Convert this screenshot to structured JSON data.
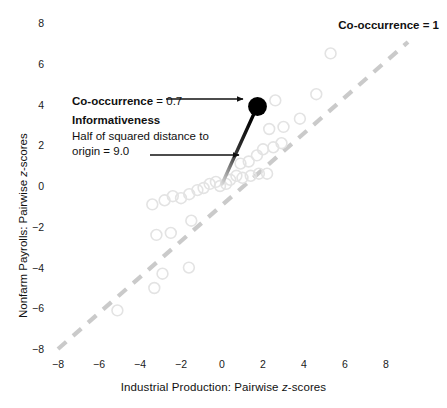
{
  "chart_data": {
    "type": "scatter",
    "title": "",
    "xlabel": "Industrial Production:  Pairwise z-scores",
    "ylabel": "Nonfarm Payrolls:  Pairwise z-scores",
    "xlim": [
      -8.8,
      8.8
    ],
    "ylim": [
      -8.8,
      8.8
    ],
    "xticks": [
      -8,
      -6,
      -4,
      -2,
      0,
      2,
      4,
      6,
      8
    ],
    "yticks": [
      -8,
      -6,
      -4,
      -2,
      0,
      2,
      4,
      6,
      8
    ],
    "xticklabels": [
      "−8",
      "−6",
      "−4",
      "−2",
      "0",
      "2",
      "4",
      "6",
      "8"
    ],
    "yticklabels": [
      "−8",
      "−6",
      "−4",
      "−2",
      "0",
      "2",
      "4",
      "6",
      "8"
    ],
    "grid": false,
    "legend": "none",
    "marker": "open-circle",
    "marker_color": "#e2e2e2",
    "points": [
      [
        -5.1,
        -6.1
      ],
      [
        -3.3,
        -5.0
      ],
      [
        -2.9,
        -4.3
      ],
      [
        -1.6,
        -4.0
      ],
      [
        -3.2,
        -2.4
      ],
      [
        -2.5,
        -2.3
      ],
      [
        -1.5,
        -1.7
      ],
      [
        -3.4,
        -0.9
      ],
      [
        -2.8,
        -0.7
      ],
      [
        -2.4,
        -0.5
      ],
      [
        -2.0,
        -0.6
      ],
      [
        -1.6,
        -0.4
      ],
      [
        -1.2,
        -0.2
      ],
      [
        -0.9,
        -0.1
      ],
      [
        -0.6,
        0.1
      ],
      [
        -0.3,
        0.2
      ],
      [
        -0.1,
        0.0
      ],
      [
        0.2,
        0.1
      ],
      [
        0.4,
        0.3
      ],
      [
        0.7,
        0.5
      ],
      [
        1.0,
        0.4
      ],
      [
        1.4,
        0.5
      ],
      [
        1.8,
        0.6
      ],
      [
        2.2,
        0.6
      ],
      [
        0.9,
        1.1
      ],
      [
        1.3,
        1.2
      ],
      [
        1.7,
        1.5
      ],
      [
        2.0,
        1.8
      ],
      [
        2.5,
        1.9
      ],
      [
        2.9,
        2.1
      ],
      [
        2.3,
        2.8
      ],
      [
        3.0,
        2.9
      ],
      [
        2.6,
        4.2
      ],
      [
        3.8,
        3.3
      ],
      [
        4.6,
        4.5
      ],
      [
        5.3,
        6.5
      ]
    ],
    "reference_line": {
      "label": "Co-occurrence = 1",
      "style": "dashed",
      "color": "#c9c9c9",
      "from": [
        -8.0,
        -8.0
      ],
      "to": [
        8.9,
        8.9
      ]
    },
    "highlight_point": {
      "x": 2.0,
      "y": 3.8,
      "color": "#000000",
      "vector_from_origin": true
    },
    "annotations": {
      "cooccurrence_bold": "Co-occurrence",
      "cooccurrence_value": " = 0.7",
      "informativeness_title": "Informativeness",
      "informativeness_line1": "Half of squared distance to",
      "informativeness_line2": "origin = 9.0",
      "reference_label_bold": "Co-occurrence",
      "reference_label_value": " = 1"
    }
  }
}
